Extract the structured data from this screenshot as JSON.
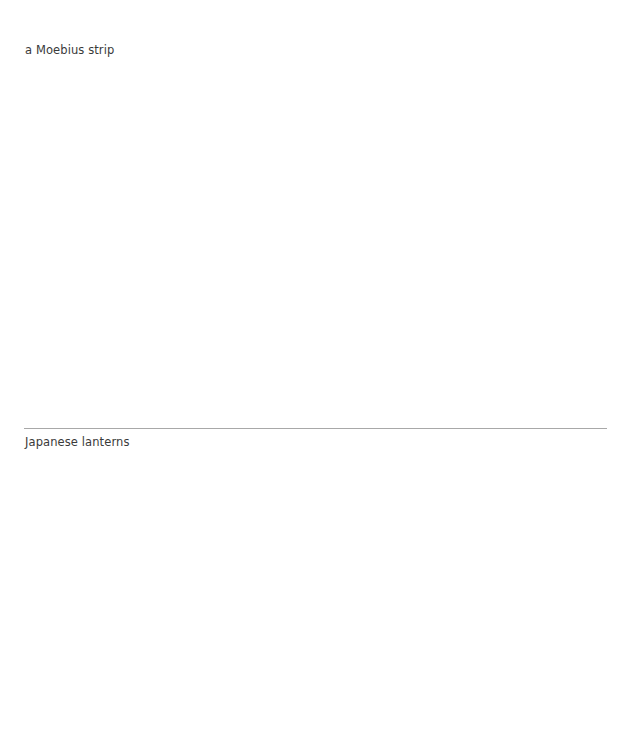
{
  "items": [
    {
      "caption": "a Moebius strip"
    },
    {
      "caption": "Japanese lanterns"
    }
  ],
  "colors": {
    "text": "#3a3a3a",
    "divider": "#a8a8a8",
    "background": "#ffffff"
  }
}
